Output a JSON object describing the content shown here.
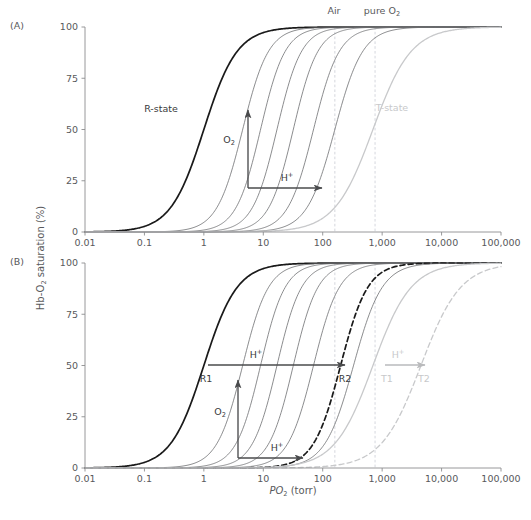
{
  "figure": {
    "width": 531,
    "height": 520,
    "background": "#ffffff",
    "y_axis_title": "Hb-O",
    "y_axis_title_sub": "2",
    "y_axis_title_rest": " saturation (%)",
    "x_axis_title_italic": "P",
    "x_axis_title_sub": "O",
    "x_axis_title_sub2": "2",
    "x_axis_title_rest": " (torr)"
  },
  "colors": {
    "text": "#58595b",
    "r_state_curve": "#1a1a1a",
    "intermediate_curve": "#6d6e71",
    "t_state_curve": "#c8c9cb",
    "axis": "#8c8d8f",
    "reference_line": "#c9cbd4",
    "arrow_dark": "#4a4b4d",
    "arrow_light": "#b9babc",
    "dashed_dark": "#1a1a1a",
    "dashed_light": "#c8c9cb"
  },
  "axes": {
    "x_ticks": [
      "0.01",
      "0.1",
      "1",
      "10",
      "100",
      "1,000",
      "10,000",
      "100,000"
    ],
    "x_tick_values": [
      0.01,
      0.1,
      1,
      10,
      100,
      1000,
      10000,
      100000
    ],
    "x_min": 0.01,
    "x_max": 100000,
    "y_ticks": [
      "0",
      "25",
      "50",
      "75",
      "100"
    ],
    "y_tick_values": [
      0,
      25,
      50,
      75,
      100
    ],
    "y_min": 0,
    "y_max": 100,
    "log_x": true
  },
  "panels": [
    {
      "id": "A",
      "letter": "(A)",
      "plot": {
        "left": 85,
        "right": 501,
        "top": 27,
        "bottom": 232
      },
      "reference_lines": [
        {
          "name": "air",
          "label": "Air",
          "value": 160,
          "label_x": 334,
          "label_y": 14
        },
        {
          "name": "pure-o2",
          "label": "pure O",
          "label_sub": "2",
          "value": 760,
          "label_x": 382,
          "label_y": 14
        }
      ],
      "curve_labels": [
        {
          "name": "r-state-label",
          "text": "R-state",
          "x": 161,
          "y": 112,
          "tone": "dark"
        },
        {
          "name": "t-state-label",
          "text": "T-state",
          "x": 392,
          "y": 111,
          "tone": "light"
        }
      ],
      "arrows": [
        {
          "name": "o2-arrow",
          "label": "O",
          "label_sub": "2",
          "dir": "up",
          "x1": 248,
          "y1": 188,
          "x2": 248,
          "y2": 110,
          "label_x": 229,
          "label_y": 143,
          "tone": "dark"
        },
        {
          "name": "h-plus-arrow",
          "label": "H",
          "label_sup": "+",
          "dir": "right",
          "x1": 248,
          "y1": 188,
          "x2": 322,
          "y2": 188,
          "label_x": 287,
          "label_y": 181,
          "tone": "dark"
        }
      ]
    },
    {
      "id": "B",
      "letter": "(B)",
      "plot": {
        "left": 85,
        "right": 501,
        "top": 263,
        "bottom": 468
      },
      "reference_lines": [
        {
          "name": "air",
          "value": 160
        },
        {
          "name": "pure-o2",
          "value": 760
        }
      ],
      "curve_labels": [
        {
          "name": "r1-label",
          "text": "R1",
          "x": 206,
          "y": 382,
          "tone": "dark"
        },
        {
          "name": "r2-label",
          "text": "R2",
          "x": 345,
          "y": 382,
          "tone": "dark"
        },
        {
          "name": "t1-label",
          "text": "T1",
          "x": 387,
          "y": 382,
          "tone": "light"
        },
        {
          "name": "t2-label",
          "text": "T2",
          "x": 424,
          "y": 382,
          "tone": "light"
        }
      ],
      "arrows": [
        {
          "name": "h-plus-arrow-upper",
          "label": "H",
          "label_sup": "+",
          "dir": "right",
          "x1": 208,
          "y1": 365,
          "x2": 345,
          "y2": 365,
          "label_x": 256,
          "label_y": 358,
          "tone": "dark"
        },
        {
          "name": "o2-arrow",
          "label": "O",
          "label_sub": "2",
          "dir": "up",
          "x1": 238,
          "y1": 458,
          "x2": 238,
          "y2": 380,
          "label_x": 220,
          "label_y": 415,
          "tone": "dark"
        },
        {
          "name": "h-plus-arrow-lower",
          "label": "H",
          "label_sup": "+",
          "dir": "right",
          "x1": 238,
          "y1": 458,
          "x2": 303,
          "y2": 458,
          "label_x": 277,
          "label_y": 451,
          "tone": "dark"
        },
        {
          "name": "h-plus-arrow-t",
          "label": "H",
          "label_sup": "+",
          "dir": "right",
          "x1": 385,
          "y1": 365,
          "x2": 425,
          "y2": 365,
          "label_x": 398,
          "label_y": 358,
          "tone": "light"
        }
      ]
    }
  ],
  "chart_data": {
    "type": "line",
    "title": "",
    "xlabel": "PO2 (torr)",
    "ylabel": "Hb-O2 saturation (%)",
    "xlim": [
      0.01,
      100000
    ],
    "ylim": [
      0,
      100
    ],
    "xscale": "log",
    "grid": false,
    "legend": "none",
    "model": "Hill equation: Y = 100 * x^n / (P50^n + x^n)",
    "panel_A": {
      "series": [
        {
          "name": "R-state",
          "p50": 1.0,
          "hill_n": 1.55,
          "style": "solid",
          "tone": "r_state",
          "width": 1.7
        },
        {
          "name": "intermediate-1",
          "p50": 4.5,
          "hill_n": 2.0,
          "style": "solid",
          "tone": "intermediate",
          "width": 0.8
        },
        {
          "name": "intermediate-2",
          "p50": 9.0,
          "hill_n": 2.1,
          "style": "solid",
          "tone": "intermediate",
          "width": 0.8
        },
        {
          "name": "intermediate-3",
          "p50": 17.0,
          "hill_n": 2.1,
          "style": "solid",
          "tone": "intermediate",
          "width": 0.8
        },
        {
          "name": "intermediate-4",
          "p50": 32.0,
          "hill_n": 2.1,
          "style": "solid",
          "tone": "intermediate",
          "width": 0.8
        },
        {
          "name": "intermediate-5",
          "p50": 70.0,
          "hill_n": 2.0,
          "style": "solid",
          "tone": "intermediate",
          "width": 0.8
        },
        {
          "name": "intermediate-6",
          "p50": 160.0,
          "hill_n": 1.85,
          "style": "solid",
          "tone": "intermediate",
          "width": 0.8
        },
        {
          "name": "T-state",
          "p50": 700.0,
          "hill_n": 1.35,
          "style": "solid",
          "tone": "t_state",
          "width": 1.3
        }
      ]
    },
    "panel_B": {
      "series": [
        {
          "name": "R1",
          "p50": 1.0,
          "hill_n": 1.55,
          "style": "solid",
          "tone": "r_state",
          "width": 1.7
        },
        {
          "name": "intermediate-1",
          "p50": 4.5,
          "hill_n": 2.0,
          "style": "solid",
          "tone": "intermediate",
          "width": 0.8
        },
        {
          "name": "intermediate-2",
          "p50": 9.0,
          "hill_n": 2.1,
          "style": "solid",
          "tone": "intermediate",
          "width": 0.8
        },
        {
          "name": "intermediate-3",
          "p50": 17.0,
          "hill_n": 2.1,
          "style": "solid",
          "tone": "intermediate",
          "width": 0.8
        },
        {
          "name": "intermediate-4",
          "p50": 32.0,
          "hill_n": 2.1,
          "style": "solid",
          "tone": "intermediate",
          "width": 0.8
        },
        {
          "name": "intermediate-5",
          "p50": 70.0,
          "hill_n": 2.0,
          "style": "solid",
          "tone": "intermediate",
          "width": 0.8
        },
        {
          "name": "R2",
          "p50": 200.0,
          "hill_n": 1.9,
          "style": "dashed",
          "tone": "r_state",
          "width": 1.7
        },
        {
          "name": "intermediate-6",
          "p50": 330.0,
          "hill_n": 1.8,
          "style": "solid",
          "tone": "intermediate",
          "width": 0.8
        },
        {
          "name": "T1",
          "p50": 700.0,
          "hill_n": 1.35,
          "style": "solid",
          "tone": "t_state",
          "width": 1.3
        },
        {
          "name": "T2",
          "p50": 4500.0,
          "hill_n": 1.3,
          "style": "dashed",
          "tone": "t_state",
          "width": 1.3
        }
      ]
    }
  }
}
